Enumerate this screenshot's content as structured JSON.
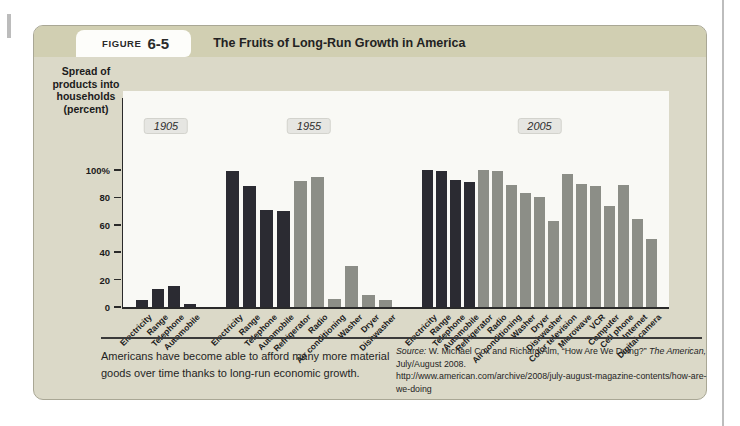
{
  "figure": {
    "label_prefix": "FIGURE",
    "label_number": "6-5",
    "title": "The Fruits of Long-Run Growth in America",
    "caption": "Americans have become able to afford many more material goods over time thanks to long-run economic growth.",
    "source": {
      "prefix": "Source:",
      "text1": " W. Michael Cox and Richard Alm, “How Are We Doing?” ",
      "italic1": "The American,",
      "text2": " July/August 2008.",
      "url": "http://www.american.com/archive/2008/july-august-magazine-contents/how-are-we-doing"
    }
  },
  "chart_data": {
    "type": "bar",
    "title": "The Fruits of Long-Run Growth in America",
    "ylabel": "Spread of products into households (percent)",
    "ylabel_multiline": "Spread of\nproducts into\nhouseholds\n(percent)",
    "ylim": [
      0,
      100
    ],
    "grid": false,
    "y_tick_labels": [
      "100%",
      "80",
      "60",
      "40",
      "20",
      "0"
    ],
    "y_tick_values": [
      100,
      80,
      60,
      40,
      20,
      0
    ],
    "colors": {
      "early_product": "#2b2b32",
      "later_product": "#8c8e87"
    },
    "groups": [
      {
        "year": "1905",
        "bars": [
          {
            "label": "Electricity",
            "value": 5,
            "era": "early_product"
          },
          {
            "label": "Range",
            "value": 13,
            "era": "early_product"
          },
          {
            "label": "Telephone",
            "value": 15,
            "era": "early_product"
          },
          {
            "label": "Automobile",
            "value": 2,
            "era": "early_product"
          }
        ]
      },
      {
        "year": "1955",
        "bars": [
          {
            "label": "Electricity",
            "value": 99,
            "era": "early_product"
          },
          {
            "label": "Range",
            "value": 88,
            "era": "early_product"
          },
          {
            "label": "Telephone",
            "value": 71,
            "era": "early_product"
          },
          {
            "label": "Automobile",
            "value": 70,
            "era": "early_product"
          },
          {
            "label": "Refrigerator",
            "value": 92,
            "era": "later_product"
          },
          {
            "label": "Radio",
            "value": 95,
            "era": "later_product"
          },
          {
            "label": "Air conditioning",
            "value": 6,
            "era": "later_product"
          },
          {
            "label": "Washer",
            "value": 30,
            "era": "later_product"
          },
          {
            "label": "Dryer",
            "value": 9,
            "era": "later_product"
          },
          {
            "label": "Dishwasher",
            "value": 5,
            "era": "later_product"
          }
        ]
      },
      {
        "year": "2005",
        "bars": [
          {
            "label": "Electricity",
            "value": 100,
            "era": "early_product"
          },
          {
            "label": "Range",
            "value": 99,
            "era": "early_product"
          },
          {
            "label": "Telephone",
            "value": 93,
            "era": "early_product"
          },
          {
            "label": "Automobile",
            "value": 91,
            "era": "early_product"
          },
          {
            "label": "Refrigerator",
            "value": 100,
            "era": "later_product"
          },
          {
            "label": "Radio",
            "value": 99,
            "era": "later_product"
          },
          {
            "label": "Air conditioning",
            "value": 89,
            "era": "later_product"
          },
          {
            "label": "Washer",
            "value": 83,
            "era": "later_product"
          },
          {
            "label": "Dryer",
            "value": 80,
            "era": "later_product"
          },
          {
            "label": "Dishwasher",
            "value": 63,
            "era": "later_product"
          },
          {
            "label": "Color television",
            "value": 97,
            "era": "later_product"
          },
          {
            "label": "Microwave",
            "value": 90,
            "era": "later_product"
          },
          {
            "label": "VCR",
            "value": 88,
            "era": "later_product"
          },
          {
            "label": "Computer",
            "value": 74,
            "era": "later_product"
          },
          {
            "label": "Cell phone",
            "value": 89,
            "era": "later_product"
          },
          {
            "label": "Internet",
            "value": 64,
            "era": "later_product"
          },
          {
            "label": "Digital camera",
            "value": 50,
            "era": "later_product"
          }
        ]
      }
    ]
  }
}
